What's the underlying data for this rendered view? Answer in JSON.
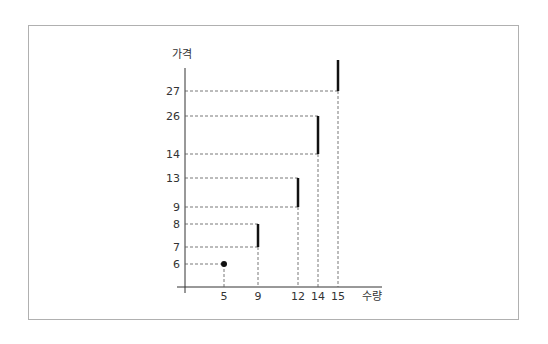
{
  "chart_data": {
    "type": "scatter",
    "title": "",
    "xlabel": "수량",
    "ylabel": "가격",
    "x_ticks": [
      5,
      9,
      12,
      14,
      15
    ],
    "y_ticks": [
      6,
      7,
      8,
      9,
      13,
      14,
      26,
      27
    ],
    "points": [
      {
        "x": 5,
        "y": 6,
        "kind": "dot"
      }
    ],
    "segments": [
      {
        "x": 9,
        "y_low": 7,
        "y_high": 8
      },
      {
        "x": 12,
        "y_low": 9,
        "y_high": 13
      },
      {
        "x": 14,
        "y_low": 14,
        "y_high": 26
      },
      {
        "x": 15,
        "y_low": 27,
        "y_high": null
      }
    ],
    "grid": false,
    "legend": "none"
  }
}
